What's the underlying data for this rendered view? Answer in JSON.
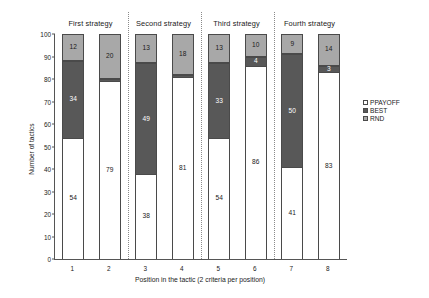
{
  "chart_data": {
    "type": "bar",
    "subtype": "stacked-100-percent",
    "title": "",
    "xlabel": "Position in the tactic (2 criteria per position)",
    "ylabel": "Number of tactics",
    "ylim": [
      0,
      100
    ],
    "yticks": [
      0,
      10,
      20,
      30,
      40,
      50,
      60,
      70,
      80,
      90,
      100
    ],
    "grid": false,
    "legend_position": "right",
    "categories": [
      "1",
      "2",
      "3",
      "4",
      "5",
      "6",
      "7",
      "8"
    ],
    "group_headers": [
      "First strategy",
      "Second strategy",
      "Third strategy",
      "Fourth strategy"
    ],
    "series": [
      {
        "name": "RND",
        "color": "#a8a8a8",
        "values": [
          12,
          20,
          13,
          18,
          13,
          10,
          9,
          14
        ],
        "labels": [
          "12",
          "20",
          "13",
          "18",
          "13",
          "10",
          "9",
          "14"
        ]
      },
      {
        "name": "BEST",
        "color": "#585858",
        "values": [
          34,
          1,
          49,
          1,
          33,
          4,
          50,
          3
        ],
        "labels": [
          "34",
          "",
          "49",
          "",
          "33",
          "4",
          "50",
          "3"
        ]
      },
      {
        "name": "PPAYOFF",
        "color": "#ffffff",
        "values": [
          54,
          79,
          38,
          81,
          54,
          86,
          41,
          83
        ],
        "labels": [
          "54",
          "79",
          "38",
          "81",
          "54",
          "86",
          "41",
          "83"
        ]
      }
    ]
  },
  "axes": {
    "y_title": "Number of tactics",
    "y_ticks": [
      "100",
      "90",
      "80",
      "70",
      "60",
      "50",
      "40",
      "30",
      "20",
      "10",
      "0"
    ],
    "x_title": "Position in the tactic (2 criteria per position)",
    "x_ticks": [
      "1",
      "2",
      "3",
      "4",
      "5",
      "6",
      "7",
      "8"
    ]
  },
  "groups": [
    {
      "label": "First strategy"
    },
    {
      "label": "Second strategy"
    },
    {
      "label": "Third strategy"
    },
    {
      "label": "Fourth strategy"
    }
  ],
  "legend": {
    "items": [
      {
        "label": "PPAYOFF",
        "color": "#ffffff"
      },
      {
        "label": "BEST",
        "color": "#585858"
      },
      {
        "label": "RND",
        "color": "#a8a8a8"
      }
    ]
  }
}
